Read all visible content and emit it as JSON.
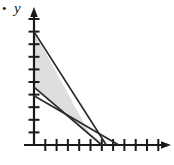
{
  "figure": {
    "bullet": "•",
    "y_axis_label": "y",
    "x_axis_label": ""
  },
  "chart_data": {
    "type": "line",
    "title": "",
    "xlabel": "",
    "ylabel": "y",
    "xlim": [
      0,
      11
    ],
    "ylim": [
      0,
      10
    ],
    "grid": false,
    "legend": "none",
    "axis_style": "arrowed",
    "x_ticks": [
      1,
      2,
      3,
      4,
      5,
      6,
      7,
      8,
      9,
      10,
      11
    ],
    "y_ticks": [
      1,
      2,
      3,
      4,
      5,
      6,
      7,
      8,
      9,
      10
    ],
    "x_tick_labels": [],
    "y_tick_labels": [],
    "series": [
      {
        "name": "line-1",
        "x": [
          0,
          6.4
        ],
        "y": [
          9.0,
          0
        ]
      },
      {
        "name": "line-2",
        "x": [
          0,
          6.0
        ],
        "y": [
          4.6,
          0
        ]
      },
      {
        "name": "line-3",
        "x": [
          0,
          7.5
        ],
        "y": [
          3.9,
          0
        ]
      }
    ],
    "shaded_region": {
      "name": "feasible-region",
      "fill": "#d8d8d8",
      "vertices": [
        [
          0,
          9.0
        ],
        [
          0,
          4.6
        ],
        [
          3.9,
          1.6
        ],
        [
          5.0,
          0.8
        ]
      ]
    },
    "colors": {
      "axis": "#1a1a1a",
      "line": "#2b2b2b",
      "shade": "#d8d8d8",
      "background": "#ffffff"
    }
  }
}
